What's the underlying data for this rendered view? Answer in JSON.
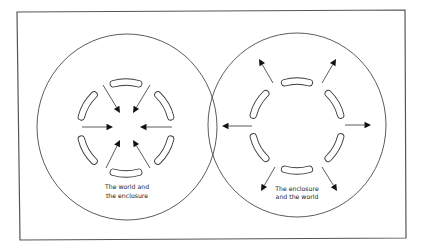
{
  "canvas": {
    "width": 424,
    "height": 250,
    "background": "#ffffff"
  },
  "frame": {
    "points": [
      [
        17,
        12
      ],
      [
        405,
        10
      ],
      [
        406,
        238
      ],
      [
        20,
        240
      ]
    ],
    "stroke": "#555555"
  },
  "diagrams": [
    {
      "id": "world-and-enclosure",
      "circle": {
        "cx": 127,
        "cy": 127,
        "rx": 90,
        "ry": 93
      },
      "ring": {
        "cx": 126,
        "cy": 128,
        "r": 46,
        "slot_angles": [
          90,
          150,
          210,
          270,
          330,
          30
        ],
        "slot_span": 32
      },
      "arrow_direction": "inward",
      "arrows": [
        {
          "from": [
            82,
            127
          ],
          "to": [
            113,
            127
          ]
        },
        {
          "from": [
            172,
            127
          ],
          "to": [
            140,
            127
          ]
        },
        {
          "from": [
            103,
            85
          ],
          "to": [
            120,
            113
          ]
        },
        {
          "from": [
            150,
            85
          ],
          "to": [
            133,
            113
          ]
        },
        {
          "from": [
            106,
            168
          ],
          "to": [
            120,
            140
          ]
        },
        {
          "from": [
            150,
            168
          ],
          "to": [
            133,
            140
          ]
        }
      ],
      "label": {
        "x": 127,
        "lines": [
          "The world and",
          "the enclosure"
        ],
        "y": [
          189,
          198
        ]
      }
    },
    {
      "id": "enclosure-and-world",
      "circle": {
        "cx": 297,
        "cy": 125,
        "rx": 89,
        "ry": 92
      },
      "ring": {
        "cx": 297,
        "cy": 126,
        "r": 45,
        "slot_angles": [
          90,
          150,
          210,
          270,
          330,
          30
        ],
        "slot_span": 32
      },
      "arrow_direction": "outward",
      "arrows": [
        {
          "from": [
            252,
            126
          ],
          "to": [
            222,
            126
          ]
        },
        {
          "from": [
            345,
            125
          ],
          "to": [
            371,
            125
          ]
        },
        {
          "from": [
            273,
            83
          ],
          "to": [
            259,
            59
          ]
        },
        {
          "from": [
            322,
            83
          ],
          "to": [
            336,
            59
          ]
        },
        {
          "from": [
            275,
            167
          ],
          "to": [
            261,
            191
          ]
        },
        {
          "from": [
            322,
            167
          ],
          "to": [
            337,
            191
          ]
        }
      ],
      "label": {
        "x": 297,
        "lines": [
          "The enclosure",
          "and the world"
        ],
        "y": [
          191,
          199
        ]
      }
    }
  ],
  "style": {
    "line_color": "#4a4a4a",
    "arrowhead_color": "#111111",
    "slot_outline": "#3a3a3a"
  }
}
